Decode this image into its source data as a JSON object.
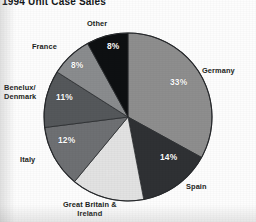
{
  "title": "1994 Unit Case Sales",
  "chart_data": {
    "type": "pie",
    "title": "1994 Unit Case Sales",
    "xlabel": "",
    "ylabel": "",
    "unit": "percent",
    "legend_position": "outside-labels",
    "grid": false,
    "start_angle_deg": 0,
    "direction": "clockwise",
    "categories": [
      "Germany",
      "Spain",
      "Great Britain & Ireland",
      "Italy",
      "Benelux/Denmark",
      "France",
      "Other"
    ],
    "values": [
      33,
      14,
      14,
      12,
      11,
      8,
      8
    ],
    "value_labels": [
      "33%",
      "14%",
      "14%",
      "12%",
      "11%",
      "8%",
      "8%"
    ],
    "colors": [
      "#8e8e8e",
      "#2f3134",
      "#e2e2e2",
      "#6e7073",
      "#55585b",
      "#8a8c8e",
      "#0e1012"
    ],
    "slices": [
      {
        "name": "Germany",
        "label": "Germany",
        "value": 33,
        "value_label": "33%",
        "color": "#8e8e8e",
        "label_x": 202,
        "label_y": 66,
        "pct_x": 170,
        "pct_y": 77,
        "pct_style": "white"
      },
      {
        "name": "Spain",
        "label": "Spain",
        "value": 14,
        "value_label": "14%",
        "color": "#2f3134",
        "label_x": 186,
        "label_y": 182,
        "pct_x": 160,
        "pct_y": 152,
        "pct_style": "white"
      },
      {
        "name": "Great Britain & Ireland",
        "label": "Great Britain &\nIreland",
        "label_line1": "Great Britain &",
        "label_line2": "Ireland",
        "value": 14,
        "value_label": "14%",
        "color": "#e2e2e2",
        "label_x": 63,
        "label_y": 200,
        "pct_x": 105,
        "pct_y": 168,
        "pct_style": "faint"
      },
      {
        "name": "Italy",
        "label": "Italy",
        "value": 12,
        "value_label": "12%",
        "color": "#6e7073",
        "label_x": 20,
        "label_y": 155,
        "pct_x": 58,
        "pct_y": 135,
        "pct_style": "white"
      },
      {
        "name": "Benelux/Denmark",
        "label": "Benelux/\nDenmark",
        "label_line1": "Benelux/",
        "label_line2": "Denmark",
        "value": 11,
        "value_label": "11%",
        "color": "#55585b",
        "label_x": 4,
        "label_y": 83,
        "pct_x": 56,
        "pct_y": 92,
        "pct_style": "white"
      },
      {
        "name": "France",
        "label": "France",
        "value": 8,
        "value_label": "8%",
        "color": "#8a8c8e",
        "label_x": 32,
        "label_y": 42,
        "pct_x": 71,
        "pct_y": 60,
        "pct_style": "white"
      },
      {
        "name": "Other",
        "label": "Other",
        "value": 8,
        "value_label": "8%",
        "color": "#0e1012",
        "label_x": 87,
        "label_y": 19,
        "pct_x": 107,
        "pct_y": 41,
        "pct_style": "dark-bg"
      }
    ],
    "geometry": {
      "center_x": 128,
      "center_y": 117,
      "radius": 84
    }
  }
}
